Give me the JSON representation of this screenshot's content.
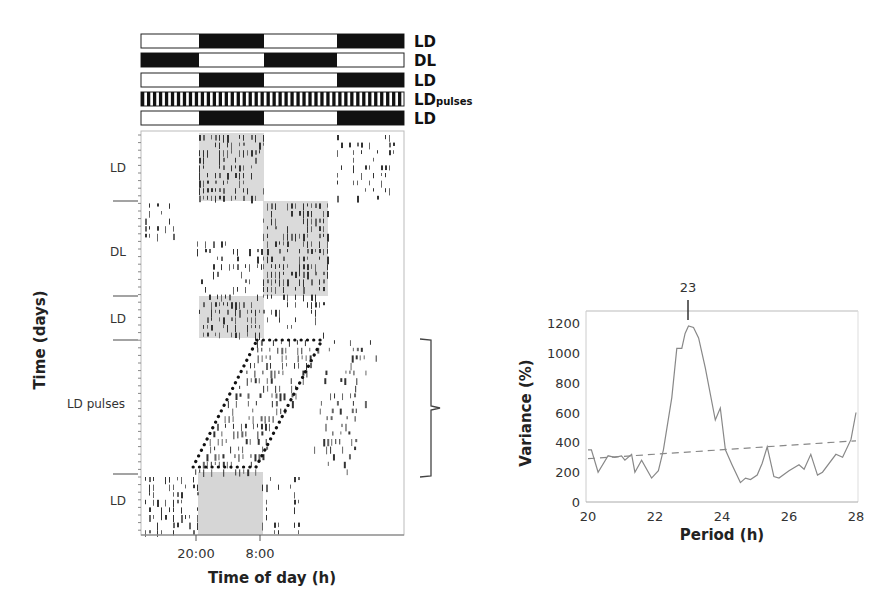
{
  "figure": {
    "light_schedule_bars": {
      "rows": [
        {
          "label": "LD",
          "sub": "",
          "pattern": "LDLD"
        },
        {
          "label": "DL",
          "sub": "",
          "pattern": "DLDL"
        },
        {
          "label": "LD",
          "sub": "",
          "pattern": "LDLD"
        },
        {
          "label": "LD",
          "sub": "pulses",
          "pattern": "pulses"
        },
        {
          "label": "LD",
          "sub": "",
          "pattern": "LDLD"
        }
      ]
    },
    "actogram": {
      "y_axis_title": "Time (days)",
      "x_axis_title": "Time of day (h)",
      "x_tick_labels": [
        "20:00",
        "8:00"
      ],
      "sections": [
        {
          "label": "LD"
        },
        {
          "label": "DL"
        },
        {
          "label": "LD"
        },
        {
          "label": "LD pulses"
        },
        {
          "label": "LD"
        }
      ]
    },
    "periodogram": {
      "peak_label": "23",
      "x_axis_title": "Period (h)",
      "y_axis_title": "Variance (%)",
      "x_tick_labels": [
        "20",
        "22",
        "24",
        "26",
        "28"
      ],
      "y_tick_labels": [
        "0",
        "200",
        "400",
        "600",
        "800",
        "1000",
        "1200"
      ]
    }
  },
  "chart_data": [
    {
      "type": "table",
      "title": "Actogram with light schedules",
      "xlabel": "Time of day (h)",
      "ylabel": "Time (days)",
      "x_ticks": [
        "20:00",
        "8:00"
      ],
      "schedules": [
        "LD",
        "DL",
        "LD",
        "LDpulses",
        "LD"
      ],
      "sections": [
        "LD",
        "DL",
        "LD",
        "LD pulses",
        "LD"
      ],
      "annotations": [
        "dotted parallelogram marking activity onset/offset drift during LD pulses",
        "bracket spanning LD pulses section"
      ]
    },
    {
      "type": "line",
      "title": "",
      "xlabel": "Period (h)",
      "ylabel": "Variance (%)",
      "xlim": [
        20,
        28
      ],
      "ylim": [
        0,
        1200
      ],
      "grid": false,
      "annotations": [
        {
          "x": 23,
          "text": "23"
        }
      ],
      "series": [
        {
          "name": "periodogram",
          "style": "solid",
          "x": [
            20.0,
            20.1,
            20.3,
            20.6,
            20.8,
            21.0,
            21.1,
            21.3,
            21.4,
            21.6,
            21.9,
            22.1,
            22.25,
            22.5,
            22.65,
            22.8,
            22.9,
            23.0,
            23.15,
            23.3,
            23.5,
            23.8,
            23.95,
            24.1,
            24.3,
            24.55,
            24.7,
            24.85,
            25.05,
            25.2,
            25.35,
            25.55,
            25.7,
            26.0,
            26.3,
            26.45,
            26.65,
            26.85,
            27.0,
            27.4,
            27.6,
            27.85,
            28.0
          ],
          "values": [
            350,
            350,
            200,
            310,
            300,
            310,
            280,
            320,
            200,
            280,
            160,
            210,
            350,
            700,
            1030,
            1030,
            1130,
            1180,
            1170,
            1100,
            900,
            550,
            630,
            350,
            250,
            130,
            160,
            150,
            180,
            260,
            370,
            170,
            160,
            210,
            250,
            220,
            320,
            180,
            200,
            320,
            300,
            420,
            600
          ]
        },
        {
          "name": "significance threshold",
          "style": "dashed",
          "x": [
            20,
            28
          ],
          "values": [
            290,
            410
          ]
        }
      ]
    }
  ]
}
